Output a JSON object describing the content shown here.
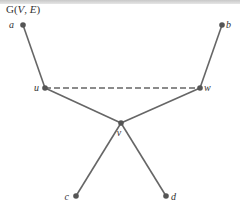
{
  "title": {
    "prefix": "G(",
    "v": "V",
    "sep": ", ",
    "e": "E",
    "suffix": ")"
  },
  "colors": {
    "edge": "#666666",
    "node": "#555555",
    "label": "#333333",
    "topbar": "#d0d0d0"
  },
  "nodes": [
    {
      "id": "a",
      "label": "a",
      "x": 23,
      "y": 25
    },
    {
      "id": "b",
      "label": "b",
      "x": 222,
      "y": 25
    },
    {
      "id": "u",
      "label": "u",
      "x": 45,
      "y": 88
    },
    {
      "id": "w",
      "label": "w",
      "x": 200,
      "y": 88
    },
    {
      "id": "v",
      "label": "v",
      "x": 121,
      "y": 123
    },
    {
      "id": "c",
      "label": "c",
      "x": 76,
      "y": 196
    },
    {
      "id": "d",
      "label": "d",
      "x": 166,
      "y": 196
    }
  ],
  "edges": [
    {
      "from": "a",
      "to": "u",
      "style": "solid"
    },
    {
      "from": "b",
      "to": "w",
      "style": "solid"
    },
    {
      "from": "u",
      "to": "v",
      "style": "solid"
    },
    {
      "from": "w",
      "to": "v",
      "style": "solid"
    },
    {
      "from": "v",
      "to": "c",
      "style": "solid"
    },
    {
      "from": "v",
      "to": "d",
      "style": "solid"
    },
    {
      "from": "u",
      "to": "w",
      "style": "dashed"
    }
  ]
}
